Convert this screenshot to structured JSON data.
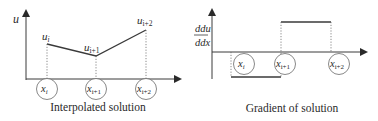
{
  "left_panel": {
    "caption": "Interpolated solution",
    "y_axis_label": "u",
    "nodes": [
      {
        "label": "x",
        "sub": "i"
      },
      {
        "label": "x",
        "sub": "i+1"
      },
      {
        "label": "x",
        "sub": "i+2"
      }
    ],
    "values": [
      {
        "label": "u",
        "sub": "i"
      },
      {
        "label": "u",
        "sub": "i+1"
      },
      {
        "label": "u",
        "sub": "i+2"
      }
    ]
  },
  "right_panel": {
    "caption": "Gradient of solution",
    "y_axis_label_num": "du",
    "y_axis_label_den": "dx",
    "nodes": [
      {
        "label": "x",
        "sub": "i"
      },
      {
        "label": "x",
        "sub": "i+1"
      },
      {
        "label": "x",
        "sub": "i+2"
      }
    ]
  },
  "colors": {
    "line": "#3a3a3a",
    "dotted": "#6a6a6a",
    "background": "#ffffff"
  }
}
